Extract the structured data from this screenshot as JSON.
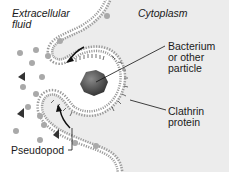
{
  "diagram": {
    "regions": {
      "extracellular": "Extracellular\nfluid",
      "cytoplasm": "Cytoplasm"
    },
    "labels": {
      "particle": "Bacterium\nor other\nparticle",
      "clathrin": "Clathrin\nprotein",
      "pseudopod": "Pseudopod"
    },
    "colors": {
      "cytoplasm_bg": "#ececec",
      "extracellular_bg": "#ffffff",
      "membrane": "#8a8a8a",
      "particle": "#4a4a4a",
      "solute": "#a9a9a9",
      "arrow": "#111111"
    }
  }
}
